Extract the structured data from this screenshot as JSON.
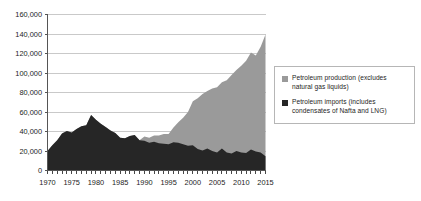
{
  "legend": {
    "position": "right",
    "box_border_color": "#b6b6b6",
    "entries": [
      {
        "label": "Petroleum production (excludes natural gas liquids)",
        "line1": "Petroleum production (excludes",
        "line2": "natural gas liquids)",
        "color": "#9a9a9a"
      },
      {
        "label": "Petroleum imports (includes condensates of Nafta and LNG)",
        "line1": "Petroleum imports (includes",
        "line2": "condensates of Nafta and LNG)",
        "color": "#262626"
      }
    ]
  },
  "chart_data": {
    "type": "area",
    "stacked": true,
    "title": "",
    "subtitle": "",
    "xlabel": "",
    "ylabel": "",
    "grid": true,
    "grid_color": "#c9c9c9",
    "axis_color": "#555555",
    "xlim": [
      1970,
      2015
    ],
    "ylim": [
      0,
      160000
    ],
    "ytick_labels": [
      "0",
      "20,000",
      "40,000",
      "60,000",
      "80,000",
      "100,000",
      "120,000",
      "140,000",
      "160,000"
    ],
    "yticks": [
      0,
      20000,
      40000,
      60000,
      80000,
      100000,
      120000,
      140000,
      160000
    ],
    "xtick_labels": [
      "1970",
      "1975",
      "1980",
      "1985",
      "1990",
      "1995",
      "2000",
      "2005",
      "2010",
      "2015"
    ],
    "xticks": [
      1970,
      1975,
      1980,
      1985,
      1990,
      1995,
      2000,
      2005,
      2010,
      2015
    ],
    "minor_xticks_every": 1,
    "x": [
      1970,
      1971,
      1972,
      1973,
      1974,
      1975,
      1976,
      1977,
      1978,
      1979,
      1980,
      1981,
      1982,
      1983,
      1984,
      1985,
      1986,
      1987,
      1988,
      1989,
      1990,
      1991,
      1992,
      1993,
      1994,
      1995,
      1996,
      1997,
      1998,
      1999,
      2000,
      2001,
      2002,
      2003,
      2004,
      2005,
      2006,
      2007,
      2008,
      2009,
      2010,
      2011,
      2012,
      2013,
      2014,
      2015
    ],
    "series": [
      {
        "name": "Petroleum imports (includes condensates of Nafta and LNG)",
        "color": "#262626",
        "stack_order": 1,
        "values": [
          20000,
          26000,
          31000,
          38000,
          40500,
          39000,
          42500,
          45500,
          46500,
          57000,
          52000,
          48000,
          44500,
          41000,
          38500,
          33500,
          33000,
          35500,
          36500,
          31000,
          30500,
          28500,
          29500,
          28000,
          27500,
          27000,
          29000,
          28500,
          27000,
          25500,
          26000,
          22000,
          20500,
          22500,
          20000,
          18500,
          22500,
          18500,
          17500,
          20000,
          18500,
          18000,
          21500,
          19500,
          18500,
          14500
        ]
      },
      {
        "name": "Petroleum production (excludes natural gas liquids)",
        "color": "#9a9a9a",
        "stack_order": 2,
        "values": [
          0,
          0,
          0,
          0,
          0,
          0,
          0,
          0,
          0,
          0,
          0,
          0,
          0,
          0,
          0,
          0,
          0,
          0,
          0,
          0,
          4500,
          5000,
          6500,
          8000,
          10000,
          10500,
          15000,
          21000,
          27000,
          34500,
          45000,
          52000,
          58000,
          59000,
          64000,
          67000,
          68000,
          74000,
          80500,
          83000,
          89000,
          94500,
          99500,
          98500,
          108500,
          125000
        ]
      }
    ],
    "totals": [
      20000,
      26000,
      31000,
      38000,
      40500,
      39000,
      42500,
      45500,
      46500,
      57000,
      52000,
      48000,
      44500,
      41000,
      38500,
      33500,
      33000,
      35500,
      36500,
      31000,
      35000,
      33500,
      36000,
      36000,
      37500,
      37500,
      44000,
      49500,
      54000,
      60000,
      71000,
      74000,
      78500,
      81500,
      84000,
      85500,
      90500,
      92500,
      98000,
      103000,
      107500,
      112500,
      121000,
      118000,
      127000,
      139500
    ]
  }
}
